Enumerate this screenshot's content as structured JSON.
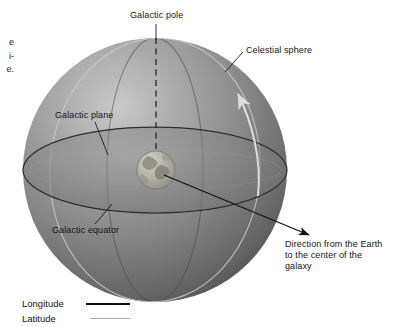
{
  "figure": {
    "kind": "astronomy-diagram",
    "background_color": "#ffffff"
  },
  "labels": {
    "galactic_pole": "Galactic pole",
    "celestial_sphere": "Celestial sphere",
    "galactic_plane": "Galactic plane",
    "galactic_equator": "Galactic equator",
    "direction_to_galactic_center": "Direction from the Earth to the center of the galaxy"
  },
  "legend": {
    "rows": [
      {
        "label": "Longitude",
        "line_color": "#111111",
        "line_style": "solid-dark"
      },
      {
        "label": "Latitude",
        "line_color": "#a8a8a8",
        "line_style": "solid-light"
      }
    ]
  },
  "caption_fragments": {
    "lines": [
      "e",
      "i-",
      "e."
    ]
  },
  "graphics": {
    "celestial_sphere": {
      "name": "celestial-sphere",
      "center_x": 155,
      "center_y": 170,
      "radius": 132,
      "fill_light": "#b9b9b9",
      "fill_mid": "#8f8f8f",
      "fill_dark": "#5f5f5f",
      "highlight_x": 105,
      "highlight_y": 105
    },
    "galactic_plane": {
      "name": "galactic-plane-ellipse",
      "center_x": 155,
      "center_y": 170,
      "radius_x": 132,
      "radius_y": 43,
      "stroke": "#2a2a2a",
      "fill": "#7d7d7d"
    },
    "earth": {
      "name": "earth-globe",
      "center_x": 156,
      "center_y": 170,
      "radius": 19,
      "fill": "#b5b5ad",
      "land_color": "#8d8d80"
    },
    "polar_axis": {
      "name": "galactic-polar-axis",
      "x": 156,
      "y_top": 38,
      "y_bottom": 152,
      "style": "dashed",
      "stroke": "#1a1a1a"
    },
    "rotation_arrow": {
      "name": "rotation-direction-arrow",
      "color": "#d8d8d8"
    },
    "direction_arrow": {
      "name": "direction-to-galactic-center-arrow",
      "from_x": 162,
      "from_y": 174,
      "to_x": 310,
      "to_y": 236,
      "stroke": "#111111"
    },
    "longitude_lines_color": "#3c3c3c",
    "latitude_lines_color": "#bdbdbd"
  }
}
